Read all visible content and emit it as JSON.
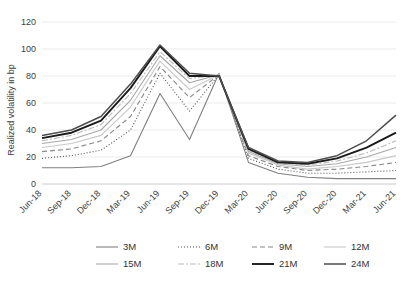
{
  "chart_data": {
    "type": "line",
    "title": "",
    "xlabel": "",
    "ylabel": "Realized volatility in bp",
    "ylim": [
      0,
      120
    ],
    "yticks": [
      0,
      20,
      40,
      60,
      80,
      100,
      120
    ],
    "grid": true,
    "legend_position": "bottom",
    "categories": [
      "Jun-18",
      "Sep-18",
      "Dec-18",
      "Mar-19",
      "Jun-19",
      "Sep-19",
      "Dec-19",
      "Mar-20",
      "Jun-20",
      "Sep-20",
      "Dec-20",
      "Mar-21",
      "Jun-21"
    ],
    "series": [
      {
        "name": "3M",
        "color": "#808080",
        "width": 1.1,
        "dash": "none",
        "values": [
          12,
          12,
          13,
          21,
          67,
          33,
          82,
          16,
          8,
          5,
          4,
          4,
          4
        ]
      },
      {
        "name": "6M",
        "color": "#555555",
        "width": 1.1,
        "dash": "1,2",
        "values": [
          19,
          21,
          25,
          40,
          82,
          54,
          81,
          19,
          11,
          8,
          8,
          9,
          10
        ]
      },
      {
        "name": "9M",
        "color": "#888888",
        "width": 1.1,
        "dash": "5,3",
        "values": [
          24,
          26,
          32,
          50,
          87,
          64,
          81,
          21,
          13,
          10,
          11,
          13,
          16
        ]
      },
      {
        "name": "12M",
        "color": "#c8c8c8",
        "width": 1.1,
        "dash": "none",
        "values": [
          27,
          30,
          36,
          57,
          91,
          70,
          81,
          23,
          14,
          11,
          13,
          16,
          21
        ]
      },
      {
        "name": "15M",
        "color": "#a8a8a8",
        "width": 1.1,
        "dash": "none",
        "values": [
          30,
          33,
          40,
          62,
          95,
          75,
          81,
          24,
          15,
          13,
          15,
          20,
          27
        ]
      },
      {
        "name": "18M",
        "color": "#bbbbbb",
        "width": 1.1,
        "dash": "6,2,2,2",
        "values": [
          32,
          36,
          44,
          67,
          98,
          78,
          81,
          25,
          16,
          14,
          17,
          23,
          32
        ]
      },
      {
        "name": "21M",
        "color": "#1a1a1a",
        "width": 1.9,
        "dash": "none",
        "values": [
          34,
          38,
          47,
          71,
          102,
          80,
          80,
          26,
          16,
          15,
          19,
          27,
          38
        ]
      },
      {
        "name": "24M",
        "color": "#4d4d4d",
        "width": 1.5,
        "dash": "none",
        "values": [
          36,
          40,
          50,
          74,
          103,
          82,
          80,
          27,
          17,
          16,
          21,
          32,
          51
        ]
      }
    ]
  },
  "legend": {
    "items": [
      {
        "label": "3M"
      },
      {
        "label": "6M"
      },
      {
        "label": "9M"
      },
      {
        "label": "12M"
      },
      {
        "label": "15M"
      },
      {
        "label": "18M"
      },
      {
        "label": "21M"
      },
      {
        "label": "24M"
      }
    ]
  }
}
